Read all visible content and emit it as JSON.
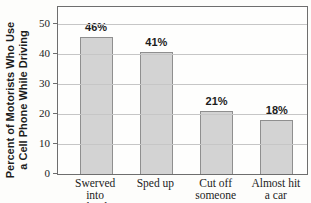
{
  "chart_data": {
    "type": "bar",
    "title": "",
    "xlabel": "",
    "ylabel": "Percent of Motorists Who Use a Cell Phone While Driving",
    "ylabel_lines": [
      "Percent of Motorists Who Use",
      "a Cell Phone While Driving"
    ],
    "categories": [
      "Swerved into another lane",
      "Sped up",
      "Cut off someone",
      "Almost hit a car"
    ],
    "category_lines": [
      [
        "Swerved into",
        "another lane"
      ],
      [
        "Sped up"
      ],
      [
        "Cut off",
        "someone"
      ],
      [
        "Almost hit",
        "a car"
      ]
    ],
    "values": [
      46,
      41,
      21,
      18
    ],
    "value_labels": [
      "46%",
      "41%",
      "21%",
      "18%"
    ],
    "ylim": [
      0,
      56
    ],
    "yticks": [
      0,
      10,
      20,
      30,
      40,
      50
    ],
    "grid": "horizontal",
    "legend": "none",
    "colors": {
      "bar_fill": "#d3d3d3",
      "bar_border": "#8f8f8f",
      "gridline": "#c6c6c6",
      "plot_border": "#6e6e6e",
      "text": "#1c1c1c"
    }
  }
}
